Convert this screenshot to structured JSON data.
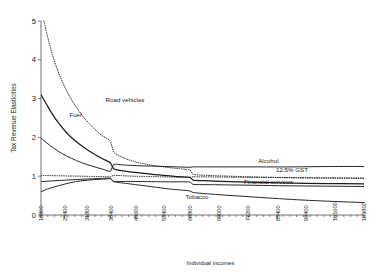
{
  "chart_data": {
    "type": "line",
    "title": "",
    "xlabel": "Individual incomes",
    "ylabel": "Tax Revenue Elasticities",
    "xlim": [
      18800,
      109800
    ],
    "ylim": [
      0,
      5
    ],
    "grid": false,
    "legend_position": "inline-right",
    "ytick_labels": [
      "0",
      "1",
      "2",
      "3",
      "4",
      "5"
    ],
    "ytick_values": [
      0,
      1,
      2,
      3,
      4,
      5
    ],
    "xtick_labels": [
      "18800",
      "25400",
      "31800",
      "38400",
      "45600",
      "53400",
      "60800",
      "69000",
      "77200",
      "85400",
      "93400",
      "101600",
      "109800"
    ],
    "xtick_values": [
      18800,
      25400,
      31800,
      38400,
      45600,
      53400,
      60800,
      69000,
      77200,
      85400,
      93400,
      101600,
      109800
    ],
    "minor_ticks": true,
    "series": [
      {
        "name": "Road vehicles",
        "style": "dotted",
        "label": "Road vehicles",
        "label_x": 37000,
        "label_y": 2.92,
        "x": [
          19600,
          20600,
          21800,
          23200,
          24800,
          26600,
          28600,
          30800,
          33200,
          35800,
          38400,
          39200,
          41500,
          45000,
          49000,
          53400,
          58000,
          60800,
          61600,
          66000,
          72000,
          80000,
          90000,
          100000,
          109800
        ],
        "y": [
          5.0,
          4.62,
          4.2,
          3.8,
          3.44,
          3.1,
          2.8,
          2.52,
          2.28,
          2.06,
          1.9,
          1.63,
          1.5,
          1.38,
          1.3,
          1.24,
          1.19,
          1.16,
          1.05,
          1.02,
          1.0,
          0.98,
          0.96,
          0.95,
          0.94
        ]
      },
      {
        "name": "Fuel",
        "style": "solid-thick",
        "label": "Fuel",
        "label_x": 26800,
        "label_y": 2.52,
        "x": [
          18800,
          20200,
          22000,
          24000,
          26200,
          28600,
          31200,
          34000,
          36800,
          38400,
          39200,
          42000,
          46000,
          50000,
          53400,
          57000,
          60800,
          61600,
          66000,
          72000,
          80000,
          90000,
          100000,
          109800
        ],
        "y": [
          3.1,
          2.88,
          2.6,
          2.34,
          2.1,
          1.9,
          1.72,
          1.56,
          1.42,
          1.34,
          1.19,
          1.14,
          1.09,
          1.05,
          1.02,
          0.99,
          0.97,
          0.9,
          0.88,
          0.86,
          0.84,
          0.82,
          0.81,
          0.8
        ]
      },
      {
        "name": "Alcohol",
        "style": "solid",
        "label": "Alcohol",
        "label_x": 80000,
        "label_y": 1.33,
        "x": [
          18800,
          20400,
          22400,
          24800,
          27400,
          30200,
          33200,
          36200,
          38400,
          39200,
          42000,
          46000,
          50000,
          53400,
          57000,
          60800,
          61600,
          66000,
          72000,
          80000,
          90000,
          100000,
          109800
        ],
        "y": [
          1.98,
          1.86,
          1.72,
          1.58,
          1.46,
          1.35,
          1.26,
          1.18,
          1.13,
          1.3,
          1.29,
          1.27,
          1.26,
          1.25,
          1.24,
          1.23,
          1.24,
          1.24,
          1.24,
          1.24,
          1.24,
          1.25,
          1.25
        ]
      },
      {
        "name": "12.5% GST",
        "style": "dotted",
        "label": "12.5% GST",
        "label_x": 85000,
        "label_y": 1.12,
        "x": [
          18800,
          24000,
          30000,
          36000,
          38400,
          39200,
          45000,
          52000,
          58000,
          60800,
          61600,
          68000,
          76000,
          86000,
          96000,
          109800
        ],
        "y": [
          1.02,
          1.01,
          1.0,
          0.99,
          0.985,
          1.02,
          1.0,
          0.985,
          0.975,
          0.97,
          0.985,
          0.98,
          0.97,
          0.965,
          0.96,
          0.955
        ]
      },
      {
        "name": "Financial services",
        "style": "solid",
        "label": "Financial services",
        "label_x": 76000,
        "label_y": 0.8,
        "x": [
          18800,
          22000,
          26000,
          30000,
          34000,
          38400,
          39200,
          44000,
          50000,
          55000,
          60800,
          61600,
          68000,
          76000,
          86000,
          96000,
          109800
        ],
        "y": [
          0.86,
          0.88,
          0.9,
          0.92,
          0.935,
          0.945,
          0.87,
          0.865,
          0.86,
          0.855,
          0.85,
          0.79,
          0.78,
          0.77,
          0.755,
          0.745,
          0.735
        ]
      },
      {
        "name": "Tobacco",
        "style": "solid",
        "label": "Tobacco",
        "label_x": 59500,
        "label_y": 0.42,
        "x": [
          18800,
          21000,
          24000,
          27000,
          30000,
          33500,
          36500,
          38400,
          39200,
          44000,
          50000,
          55000,
          60800,
          61600,
          68000,
          76000,
          86000,
          96000,
          109800
        ],
        "y": [
          0.6,
          0.68,
          0.76,
          0.83,
          0.88,
          0.91,
          0.925,
          0.93,
          0.86,
          0.8,
          0.73,
          0.67,
          0.62,
          0.58,
          0.53,
          0.48,
          0.42,
          0.37,
          0.32
        ]
      }
    ]
  },
  "colors": {
    "line": "#1c1c1c",
    "axis": "#4d4d4d",
    "background": "#ffffff"
  }
}
